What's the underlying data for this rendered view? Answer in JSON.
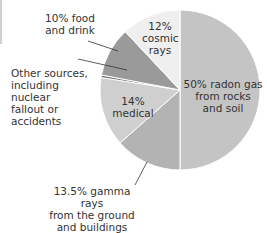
{
  "chart_data": {
    "type": "pie",
    "title": "",
    "slices": [
      {
        "label": "radon gas from rocks and soil",
        "value": 50,
        "color": "#c4c4c4"
      },
      {
        "label": "gamma rays from the ground and buildings",
        "value": 13.5,
        "color": "#b3b3b3"
      },
      {
        "label": "medical",
        "value": 14,
        "color": "#cfcfcf"
      },
      {
        "label": "Other sources, including nuclear fallout or accidents",
        "value": 0.5,
        "color": "#6e6e6e"
      },
      {
        "label": "food and drink",
        "value": 10,
        "color": "#9a9a9a"
      },
      {
        "label": "cosmic rays",
        "value": 12,
        "color": "#efefef"
      }
    ],
    "start_angle_deg": 0,
    "direction": "clockwise",
    "legend": "none"
  },
  "labels": {
    "food": [
      "10% food",
      "and drink"
    ],
    "cosmic": [
      "12%",
      "cosmic",
      "rays"
    ],
    "other": [
      "Other sources,",
      "including",
      "nuclear",
      "fallout or",
      "accidents"
    ],
    "medical": [
      "14%",
      "medical"
    ],
    "radon": [
      "50% radon gas",
      "from rocks",
      "and soil"
    ],
    "gamma": [
      "13.5% gamma rays",
      "from the ground",
      "and buildings"
    ]
  }
}
